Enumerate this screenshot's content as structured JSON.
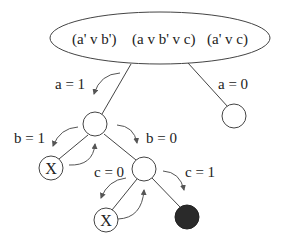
{
  "diagram": {
    "root": {
      "shape": "ellipse",
      "clauses": [
        "(a' v b')",
        "(a v b' v c)",
        "(a' v c)"
      ]
    },
    "edges": [
      {
        "label": "a = 1",
        "from": "root",
        "to": "n_a1"
      },
      {
        "label": "a = 0",
        "from": "root",
        "to": "n_a0"
      },
      {
        "label": "b = 1",
        "from": "n_a1",
        "to": "n_b1"
      },
      {
        "label": "b = 0",
        "from": "n_a1",
        "to": "n_b0"
      },
      {
        "label": "c = 0",
        "from": "n_b0",
        "to": "n_c0"
      },
      {
        "label": "c = 1",
        "from": "n_b0",
        "to": "n_c1"
      }
    ],
    "nodes": {
      "n_a1": {
        "label": "",
        "status": "open"
      },
      "n_a0": {
        "label": "",
        "status": "open"
      },
      "n_b1": {
        "label": "X",
        "status": "conflict"
      },
      "n_b0": {
        "label": "",
        "status": "open"
      },
      "n_c0": {
        "label": "X",
        "status": "conflict"
      },
      "n_c1": {
        "label": "",
        "status": "solution",
        "fill": "#2a2a2a"
      }
    },
    "icons": {
      "descend_arrow": "curved-arrow-down",
      "backtrack_arrow": "curved-arrow-up"
    }
  }
}
